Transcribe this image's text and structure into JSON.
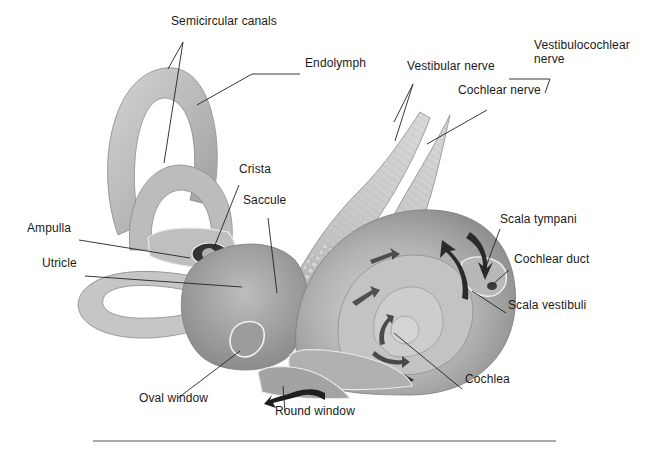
{
  "figure": {
    "colors": {
      "background": "#ffffff",
      "tissue_light": "#c9c9c9",
      "tissue_mid": "#a8a8a8",
      "tissue_dark": "#7d7d7d",
      "arrow": "#1a1a1a",
      "leader_line": "#222222",
      "rule": "#555555"
    },
    "labels": [
      {
        "id": "semicircular-canals",
        "text": "Semicircular canals",
        "x": 171,
        "y": 26
      },
      {
        "id": "endolymph",
        "text": "Endolymph",
        "x": 305,
        "y": 68
      },
      {
        "id": "vestibular-nerve",
        "text": "Vestibular nerve",
        "x": 407,
        "y": 71
      },
      {
        "id": "vestibulocochlear-nerve",
        "text": "Vestibulocochlear nerve",
        "x": 534,
        "y": 49
      },
      {
        "id": "cochlear-nerve",
        "text": "Cochlear nerve",
        "x": 458,
        "y": 95
      },
      {
        "id": "crista",
        "text": "Crista",
        "x": 239,
        "y": 174
      },
      {
        "id": "saccule",
        "text": "Saccule",
        "x": 243,
        "y": 205
      },
      {
        "id": "ampulla",
        "text": "Ampulla",
        "x": 27,
        "y": 233
      },
      {
        "id": "utricle",
        "text": "Utricle",
        "x": 42,
        "y": 268
      },
      {
        "id": "scala-tympani",
        "text": "Scala tympani",
        "x": 500,
        "y": 224
      },
      {
        "id": "cochlear-duct",
        "text": "Cochlear duct",
        "x": 514,
        "y": 264
      },
      {
        "id": "scala-vestibuli",
        "text": "Scala vestibuli",
        "x": 508,
        "y": 310
      },
      {
        "id": "oval-window",
        "text": "Oval window",
        "x": 139,
        "y": 403
      },
      {
        "id": "cochlea",
        "text": "Cochlea",
        "x": 465,
        "y": 384
      },
      {
        "id": "round-window",
        "text": "Round window",
        "x": 275,
        "y": 416
      }
    ],
    "leader_lines": [
      {
        "for": "semicircular-canals",
        "points": [
          [
            183,
            42
          ],
          [
            168,
            69
          ]
        ]
      },
      {
        "for": "semicircular-canals",
        "points": [
          [
            183,
            42
          ],
          [
            164,
            163
          ]
        ]
      },
      {
        "for": "endolymph",
        "points": [
          [
            300,
            74
          ],
          [
            252,
            74
          ],
          [
            197,
            105
          ]
        ]
      },
      {
        "for": "vestibular-nerve",
        "points": [
          [
            413,
            84
          ],
          [
            394,
            122
          ]
        ]
      },
      {
        "for": "vestibular-nerve",
        "points": [
          [
            413,
            84
          ],
          [
            395,
            141
          ]
        ]
      },
      {
        "for": "cochlear-nerve",
        "points": [
          [
            487,
            110
          ],
          [
            427,
            144
          ]
        ]
      },
      {
        "for": "vestibulocochlear-nerve",
        "points": [
          [
            509,
            79
          ],
          [
            550,
            79
          ],
          [
            545,
            93
          ]
        ]
      },
      {
        "for": "crista",
        "points": [
          [
            239,
            185
          ],
          [
            213,
            250
          ]
        ]
      },
      {
        "for": "saccule",
        "points": [
          [
            268,
            218
          ],
          [
            277,
            293
          ]
        ]
      },
      {
        "for": "ampulla",
        "points": [
          [
            79,
            240
          ],
          [
            190,
            258
          ]
        ]
      },
      {
        "for": "utricle",
        "points": [
          [
            85,
            276
          ],
          [
            242,
            287
          ]
        ]
      },
      {
        "for": "scala-tympani",
        "points": [
          [
            500,
            229
          ],
          [
            484,
            272
          ]
        ]
      },
      {
        "for": "cochlear-duct",
        "points": [
          [
            509,
            270
          ],
          [
            492,
            285
          ]
        ]
      },
      {
        "for": "scala-vestibuli",
        "points": [
          [
            506,
            313
          ],
          [
            472,
            291
          ]
        ]
      },
      {
        "for": "oval-window",
        "points": [
          [
            178,
            398
          ],
          [
            240,
            351
          ]
        ]
      },
      {
        "for": "cochlea",
        "points": [
          [
            462,
            389
          ],
          [
            394,
            333
          ]
        ]
      },
      {
        "for": "round-window",
        "points": [
          [
            285,
            412
          ],
          [
            283,
            386
          ]
        ]
      }
    ],
    "bottom_rule": {
      "x1": 93,
      "x2": 556,
      "y": 441
    }
  }
}
